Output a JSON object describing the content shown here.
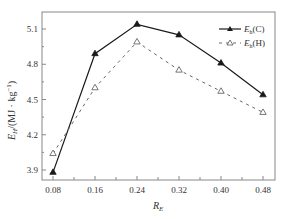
{
  "chart_data": {
    "type": "line",
    "title": "",
    "xlabel": "R_E",
    "xlabel_main": "R",
    "xlabel_sub": "E",
    "ylabel": "E_H/(MJ·kg⁻¹)",
    "ylabel_main": "E",
    "ylabel_sub": "H",
    "ylabel_unit": "/(MJ · kg",
    "ylabel_exp": "−1",
    "ylabel_close": ")",
    "x": [
      0.08,
      0.16,
      0.24,
      0.32,
      0.4,
      0.48
    ],
    "x_ticks": [
      "0.08",
      "0.16",
      "0.24",
      "0.32",
      "0.40",
      "0.48"
    ],
    "y_ticks": [
      "3.9",
      "4.2",
      "4.5",
      "4.8",
      "5.1"
    ],
    "xlim": [
      0.05,
      0.5
    ],
    "ylim": [
      3.85,
      5.21
    ],
    "grid": false,
    "legend_position": "upper right",
    "series": [
      {
        "name": "E_h(C)",
        "label_main": "E",
        "label_sub": "h",
        "label_tail": "(C)",
        "style": "solid",
        "marker": "filled-triangle",
        "color": "#1a1a1a",
        "values": [
          3.88,
          4.89,
          5.14,
          5.05,
          4.81,
          4.54
        ]
      },
      {
        "name": "E_h(H)",
        "label_main": "E",
        "label_sub": "h",
        "label_tail": "(H)",
        "style": "dashed",
        "marker": "open-triangle",
        "color": "#666666",
        "values": [
          4.04,
          4.6,
          4.99,
          4.75,
          4.57,
          4.39
        ]
      }
    ]
  }
}
